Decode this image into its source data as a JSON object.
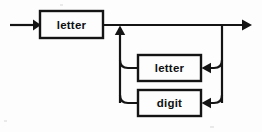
{
  "diagram": {
    "kind": "railroad-syntax-diagram",
    "background_color": "#fdfdfd",
    "line_color": "#141414",
    "box_fill_color": "#fdfdfd",
    "entry": {
      "label": "entry-arrow",
      "direction": "right"
    },
    "exit": {
      "label": "exit-arrow",
      "direction": "right"
    },
    "nodes": [
      {
        "id": "first-letter",
        "label": "letter",
        "shape": "rect",
        "x": 40,
        "y": 11,
        "width": 63,
        "height": 27
      },
      {
        "id": "loop-letter",
        "label": "letter",
        "shape": "rect",
        "x": 138,
        "y": 55,
        "width": 63,
        "height": 26
      },
      {
        "id": "loop-digit",
        "label": "digit",
        "shape": "rect",
        "x": 138,
        "y": 90,
        "width": 63,
        "height": 26
      }
    ],
    "rails": {
      "main_line_y": 25,
      "loop_left_x": 120,
      "loop_right_x": 222,
      "letter_row_y": 68,
      "digit_row_y": 103
    }
  }
}
